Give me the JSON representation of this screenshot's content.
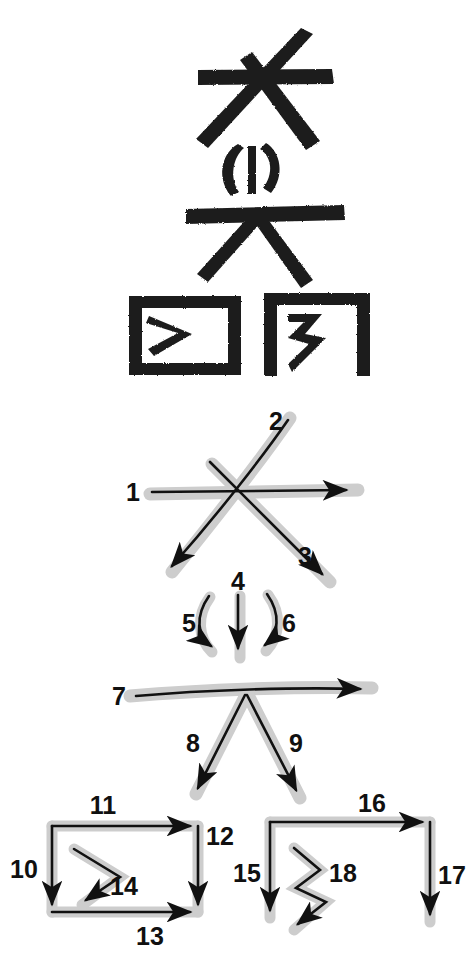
{
  "page": {
    "width": 476,
    "height": 980,
    "background_color": "#ffffff",
    "ink_color": "#1a1a1a",
    "shadow_color": "#c9c9c9",
    "stroke_line_color": "#111111"
  },
  "specimen": {
    "caption": "brush-written character specimen",
    "components": [
      {
        "name": "top-cross-component",
        "description": "long horizontal stroke crossed by two diagonal strokes"
      },
      {
        "name": "middle-parenthesis-component",
        "description": "left curve, vertical tick, right curve"
      },
      {
        "name": "middle-cross-component",
        "description": "horizontal stroke with two diagonals descending"
      },
      {
        "name": "bottom-left-box-component",
        "description": "closed rectangle enclosing an arrow-head shape"
      },
      {
        "name": "bottom-right-bracket-component",
        "description": "open bracket enclosing a zig-zag shape"
      }
    ]
  },
  "steps": {
    "caption": "numbered stroke order, 18 strokes",
    "total_strokes": 18,
    "groups": [
      {
        "name": "group-cross-top",
        "labels": [
          "1",
          "2",
          "3"
        ],
        "strokes": [
          {
            "number": "1",
            "kind": "horizontal-rightward",
            "direction": "left-to-right"
          },
          {
            "number": "2",
            "kind": "diagonal-downleft",
            "direction": "upper-right-to-lower-left"
          },
          {
            "number": "3",
            "kind": "diagonal-downright",
            "direction": "upper-left-to-lower-right"
          }
        ]
      },
      {
        "name": "group-parenthesis",
        "labels": [
          "4",
          "5",
          "6"
        ],
        "strokes": [
          {
            "number": "4",
            "kind": "vertical-down",
            "direction": "top-to-bottom"
          },
          {
            "number": "5",
            "kind": "curve-left-down",
            "direction": "top-to-bottom curving left"
          },
          {
            "number": "6",
            "kind": "curve-right-down",
            "direction": "top-to-bottom curving right"
          }
        ]
      },
      {
        "name": "group-cross-middle",
        "labels": [
          "7",
          "8",
          "9"
        ],
        "strokes": [
          {
            "number": "7",
            "kind": "horizontal-rightward",
            "direction": "left-to-right"
          },
          {
            "number": "8",
            "kind": "diagonal-downleft",
            "direction": "top-to-lower-left"
          },
          {
            "number": "9",
            "kind": "diagonal-downright",
            "direction": "top-to-lower-right"
          }
        ]
      },
      {
        "name": "group-left-box",
        "labels": [
          "10",
          "11",
          "12",
          "13",
          "14"
        ],
        "strokes": [
          {
            "number": "10",
            "kind": "vertical-down",
            "direction": "top-to-bottom (left side)"
          },
          {
            "number": "11",
            "kind": "horizontal-rightward",
            "direction": "left-to-right (top side)"
          },
          {
            "number": "12",
            "kind": "vertical-down",
            "direction": "top-to-bottom (right side)"
          },
          {
            "number": "13",
            "kind": "horizontal-rightward",
            "direction": "left-to-right (bottom side)"
          },
          {
            "number": "14",
            "kind": "chevron-downleft",
            "direction": "down-right then down-left inside the box"
          }
        ]
      },
      {
        "name": "group-right-bracket",
        "labels": [
          "15",
          "16",
          "17",
          "18"
        ],
        "strokes": [
          {
            "number": "15",
            "kind": "vertical-down",
            "direction": "top-to-bottom (left side)"
          },
          {
            "number": "16",
            "kind": "horizontal-rightward",
            "direction": "left-to-right (top side)"
          },
          {
            "number": "17",
            "kind": "vertical-down",
            "direction": "top-to-bottom (right side)"
          },
          {
            "number": "18",
            "kind": "zigzag-downleft",
            "direction": "zig-zag descending to lower-left"
          }
        ]
      }
    ]
  }
}
